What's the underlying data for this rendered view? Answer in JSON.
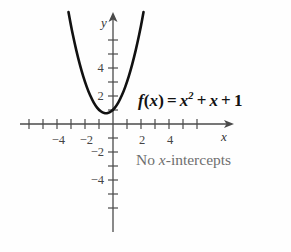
{
  "chart_data": {
    "type": "line",
    "title": "",
    "subtitle": "",
    "function_label": "f(x) = x² + x + 1",
    "function_parts": {
      "fname": "f",
      "arg_open": "(",
      "arg": "x",
      "arg_close": ")",
      "equals": "=",
      "term1_base": "x",
      "term1_exp": "2",
      "plus1": "+",
      "term2": "x",
      "plus2": "+",
      "term3": "1"
    },
    "equation_coefficients": {
      "a": 1,
      "b": 1,
      "c": 1
    },
    "vertex": {
      "x": -0.5,
      "y": 0.75
    },
    "y_intercept": 1,
    "x_intercepts": [],
    "annotation": "No x-intercepts",
    "annotation_parts": {
      "lead": "No ",
      "italic": "x",
      "tail": "-intercepts"
    },
    "xlabel": "x",
    "ylabel": "y",
    "xlim": [
      -6.6,
      6.2
    ],
    "ylim": [
      -6.4,
      6.6
    ],
    "xticks": [
      -6,
      -5,
      -4,
      -3,
      -2,
      -1,
      1,
      2,
      3,
      4,
      5,
      6
    ],
    "yticks": [
      -6,
      -5,
      -4,
      -3,
      -2,
      -1,
      1,
      2,
      3,
      4,
      5,
      6
    ],
    "xtick_labels": [
      {
        "value": -4,
        "text": "−4"
      },
      {
        "value": -2,
        "text": "−2"
      },
      {
        "value": 2,
        "text": "2"
      },
      {
        "value": 4,
        "text": "4"
      }
    ],
    "ytick_labels": [
      {
        "value": 4,
        "text": "4"
      },
      {
        "value": 2,
        "text": "2"
      },
      {
        "value": -2,
        "text": "−2"
      },
      {
        "value": -4,
        "text": "−4"
      }
    ],
    "grid": false,
    "legend": "none",
    "curve_points": [
      {
        "x": -3.18,
        "y": 8.0
      },
      {
        "x": -3.0,
        "y": 7.0
      },
      {
        "x": -2.75,
        "y": 5.81
      },
      {
        "x": -2.5,
        "y": 4.75
      },
      {
        "x": -2.25,
        "y": 3.81
      },
      {
        "x": -2.0,
        "y": 3.0
      },
      {
        "x": -1.75,
        "y": 2.31
      },
      {
        "x": -1.5,
        "y": 1.75
      },
      {
        "x": -1.25,
        "y": 1.31
      },
      {
        "x": -1.0,
        "y": 1.0
      },
      {
        "x": -0.75,
        "y": 0.81
      },
      {
        "x": -0.5,
        "y": 0.75
      },
      {
        "x": -0.25,
        "y": 0.81
      },
      {
        "x": 0.0,
        "y": 1.0
      },
      {
        "x": 0.25,
        "y": 1.31
      },
      {
        "x": 0.5,
        "y": 1.75
      },
      {
        "x": 0.75,
        "y": 2.31
      },
      {
        "x": 1.0,
        "y": 3.0
      },
      {
        "x": 1.25,
        "y": 3.81
      },
      {
        "x": 1.5,
        "y": 4.75
      },
      {
        "x": 1.75,
        "y": 5.81
      },
      {
        "x": 2.0,
        "y": 7.0
      },
      {
        "x": 2.18,
        "y": 8.0
      }
    ],
    "colors": {
      "curve": "#111111",
      "axis": "#4a4a4a",
      "tick_label": "#444444",
      "equation": "#121212",
      "annotation": "#6e6e6e",
      "background": "#fefefe"
    }
  }
}
